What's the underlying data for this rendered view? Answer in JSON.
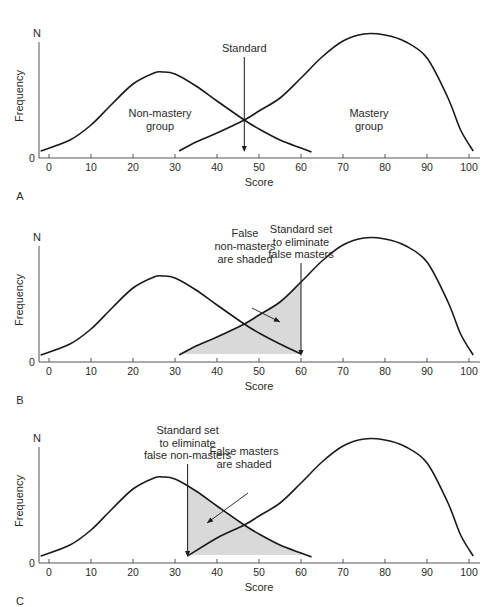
{
  "chart_data": [
    {
      "panel": "A",
      "type": "line",
      "xlabel": "Score",
      "ylabel": "Frequency",
      "y_top_label": "N",
      "y_zero_label": "0",
      "xticks": [
        0,
        10,
        20,
        30,
        40,
        50,
        60,
        70,
        80,
        90,
        100
      ],
      "xlim": [
        -2,
        103
      ],
      "series": [
        {
          "name": "Non-mastery group",
          "label_lines": [
            "Non-mastery",
            "group"
          ],
          "points": [
            [
              -2,
              7
            ],
            [
              5,
              18
            ],
            [
              10,
              33
            ],
            [
              15,
              54
            ],
            [
              20,
              74
            ],
            [
              25,
              85
            ],
            [
              27,
              86
            ],
            [
              30,
              84
            ],
            [
              35,
              72
            ],
            [
              40,
              57
            ],
            [
              46.5,
              38
            ],
            [
              50,
              29
            ],
            [
              55,
              18
            ],
            [
              60,
              10
            ],
            [
              62.5,
              6
            ]
          ]
        },
        {
          "name": "Mastery group",
          "label_lines": [
            "Mastery",
            "group"
          ],
          "points": [
            [
              31,
              7
            ],
            [
              35,
              16
            ],
            [
              40,
              25
            ],
            [
              46.5,
              38
            ],
            [
              50,
              47
            ],
            [
              55,
              60
            ],
            [
              60,
              80
            ],
            [
              65,
              101
            ],
            [
              70,
              117
            ],
            [
              75,
              124
            ],
            [
              80,
              123
            ],
            [
              85,
              116
            ],
            [
              90,
              100
            ],
            [
              95,
              60
            ],
            [
              98,
              28
            ],
            [
              101,
              7
            ]
          ]
        }
      ],
      "standard": {
        "score": 46.5,
        "label_lines": [
          "Standard"
        ]
      },
      "shading": null
    },
    {
      "panel": "B",
      "type": "line",
      "xlabel": "Score",
      "ylabel": "Frequency",
      "y_top_label": "N",
      "y_zero_label": "0",
      "xticks": [
        0,
        10,
        20,
        30,
        40,
        50,
        60,
        70,
        80,
        90,
        100
      ],
      "xlim": [
        -2,
        103
      ],
      "series": [
        {
          "name": "Non-mastery group",
          "points": [
            [
              -2,
              7
            ],
            [
              5,
              18
            ],
            [
              10,
              33
            ],
            [
              15,
              54
            ],
            [
              20,
              74
            ],
            [
              25,
              85
            ],
            [
              27,
              86
            ],
            [
              30,
              84
            ],
            [
              35,
              72
            ],
            [
              40,
              57
            ],
            [
              46.5,
              38
            ],
            [
              50,
              29
            ],
            [
              55,
              18
            ],
            [
              60,
              8
            ]
          ]
        },
        {
          "name": "Mastery group",
          "points": [
            [
              31,
              7
            ],
            [
              35,
              16
            ],
            [
              40,
              25
            ],
            [
              46.5,
              38
            ],
            [
              50,
              47
            ],
            [
              55,
              60
            ],
            [
              60,
              80
            ],
            [
              65,
              101
            ],
            [
              70,
              117
            ],
            [
              75,
              124
            ],
            [
              80,
              123
            ],
            [
              85,
              116
            ],
            [
              90,
              100
            ],
            [
              95,
              60
            ],
            [
              98,
              28
            ],
            [
              101,
              7
            ]
          ]
        }
      ],
      "standard": {
        "score": 60,
        "label_lines": [
          "Standard set",
          "to eliminate",
          "false masters"
        ]
      },
      "shading": {
        "under_series": "Mastery group",
        "from": 31,
        "to": 60,
        "label_lines": [
          "False",
          "non-masters",
          "are shaded"
        ]
      }
    },
    {
      "panel": "C",
      "type": "line",
      "xlabel": "Score",
      "ylabel": "Frequency",
      "y_top_label": "N",
      "y_zero_label": "0",
      "xticks": [
        0,
        10,
        20,
        30,
        40,
        50,
        60,
        70,
        80,
        90,
        100
      ],
      "xlim": [
        -2,
        103
      ],
      "series": [
        {
          "name": "Non-mastery group",
          "points": [
            [
              -2,
              7
            ],
            [
              5,
              18
            ],
            [
              10,
              33
            ],
            [
              15,
              54
            ],
            [
              20,
              74
            ],
            [
              25,
              85
            ],
            [
              27,
              86
            ],
            [
              30,
              84
            ],
            [
              35,
              72
            ],
            [
              40,
              57
            ],
            [
              46.5,
              38
            ],
            [
              50,
              29
            ],
            [
              55,
              18
            ],
            [
              60,
              10
            ],
            [
              62.5,
              6
            ]
          ]
        },
        {
          "name": "Mastery group",
          "points": [
            [
              33,
              7
            ],
            [
              40,
              25
            ],
            [
              46.5,
              38
            ],
            [
              50,
              47
            ],
            [
              55,
              60
            ],
            [
              60,
              80
            ],
            [
              65,
              101
            ],
            [
              70,
              117
            ],
            [
              75,
              124
            ],
            [
              80,
              123
            ],
            [
              85,
              116
            ],
            [
              90,
              100
            ],
            [
              95,
              60
            ],
            [
              98,
              28
            ],
            [
              101,
              7
            ]
          ]
        }
      ],
      "standard": {
        "score": 33,
        "label_lines": [
          "Standard set",
          "to eliminate",
          "false non-masters"
        ]
      },
      "shading": {
        "under_series": "Non-mastery group",
        "from": 33,
        "to": 62.5,
        "label_lines": [
          "False masters",
          "are shaded"
        ]
      }
    }
  ],
  "panel_letters": [
    "A",
    "B",
    "C"
  ],
  "colors": {
    "line": "#1a1a1a",
    "axis": "#555555",
    "shade": "#d9d9d9",
    "text": "#2a2a2a"
  }
}
